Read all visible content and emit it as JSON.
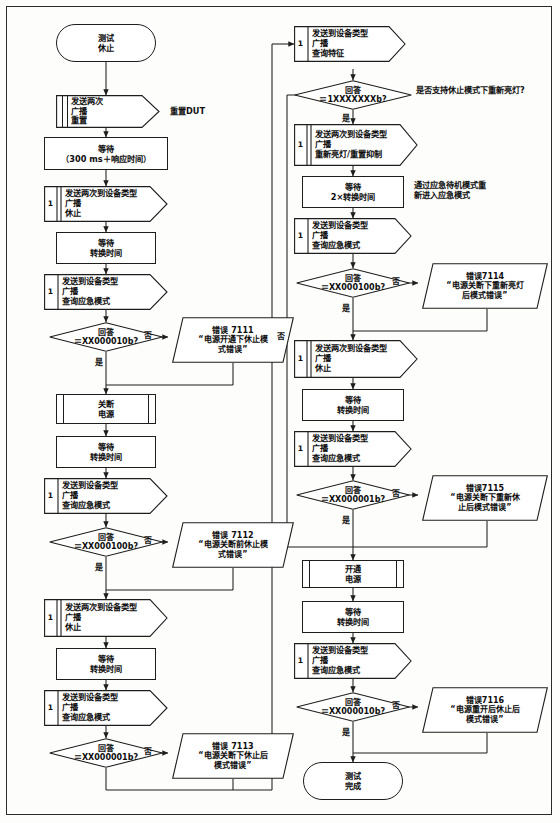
{
  "diagram": {
    "type": "flowchart",
    "labels": {
      "yes": "是",
      "no": "否"
    },
    "annotations": [
      {
        "id": "anno-reset-dut",
        "text": "重置DUT",
        "lines": [
          "重置DUT"
        ]
      },
      {
        "id": "anno-support-question",
        "text": "是否支持休止模式下重新亮灯?",
        "lines": [
          "是否支持休止模式下重新亮灯?"
        ]
      },
      {
        "id": "anno-reenter-emergency",
        "text": "通过应急待机模式重新进入应急模式",
        "lines": [
          "通过应急待机模式重",
          "新进入应急模式"
        ]
      }
    ],
    "left_column": [
      {
        "id": "start",
        "shape": "terminator",
        "lines": [
          "测试",
          "休止"
        ]
      },
      {
        "id": "send-reset",
        "shape": "send",
        "index": "",
        "lines": [
          "发送两次",
          "广播",
          "重置"
        ]
      },
      {
        "id": "wait-300ms",
        "shape": "process",
        "lines": [
          "等待",
          "（300 ms＋响应时间）"
        ]
      },
      {
        "id": "send-rest-1",
        "shape": "send",
        "index": "1",
        "double": true,
        "lines": [
          "发送两次到设备类型",
          "广播",
          "休止"
        ]
      },
      {
        "id": "wait-switch-1",
        "shape": "process",
        "lines": [
          "等待",
          "转换时间"
        ]
      },
      {
        "id": "query-mode-1",
        "shape": "send",
        "index": "1",
        "lines": [
          "发送到设备类型",
          "广播",
          "查询应急模式"
        ]
      },
      {
        "id": "dec-7111",
        "shape": "decision",
        "lines": [
          "回答",
          "＝XX000010b?"
        ]
      },
      {
        "id": "err-7111",
        "shape": "error",
        "lines": [
          "错误  7111",
          "“电源开通下休止模",
          "式错误”"
        ]
      },
      {
        "id": "power-off",
        "shape": "predefined",
        "lines": [
          "关断",
          "电源"
        ]
      },
      {
        "id": "wait-switch-2",
        "shape": "process",
        "lines": [
          "等待",
          "转换时间"
        ]
      },
      {
        "id": "query-mode-2",
        "shape": "send",
        "index": "1",
        "lines": [
          "发送到设备类型",
          "广播",
          "查询应急模式"
        ]
      },
      {
        "id": "dec-7112",
        "shape": "decision",
        "lines": [
          "回答",
          "＝XX000100b?"
        ]
      },
      {
        "id": "err-7112",
        "shape": "error",
        "lines": [
          "错误  7112",
          "“电源关断前休止模",
          "式错误”"
        ]
      },
      {
        "id": "send-rest-2",
        "shape": "send",
        "index": "1",
        "double": true,
        "lines": [
          "发送两次到设备类型",
          "广播",
          "休止"
        ]
      },
      {
        "id": "wait-switch-3",
        "shape": "process",
        "lines": [
          "等待",
          "转换时间"
        ]
      },
      {
        "id": "query-mode-3",
        "shape": "send",
        "index": "1",
        "lines": [
          "发送到设备类型",
          "广播",
          "查询应急模式"
        ]
      },
      {
        "id": "dec-7113",
        "shape": "decision",
        "lines": [
          "回答",
          "＝XX000001b?"
        ]
      },
      {
        "id": "err-7113",
        "shape": "error",
        "lines": [
          "错误  7113",
          "“电源关断下休止后",
          "模式错误”"
        ]
      }
    ],
    "right_column": [
      {
        "id": "query-feature",
        "shape": "send",
        "index": "1",
        "lines": [
          "发送到设备类型",
          "广播",
          "查询特征"
        ]
      },
      {
        "id": "dec-support",
        "shape": "decision",
        "lines": [
          "回答",
          "＝1XXXXXXXb?"
        ]
      },
      {
        "id": "send-relight",
        "shape": "send",
        "index": "1",
        "double": true,
        "lines": [
          "发送两次到设备类型",
          "广播",
          "重新亮灯/重置抑制"
        ]
      },
      {
        "id": "wait-2x",
        "shape": "process",
        "lines": [
          "等待",
          "2×转换时间"
        ]
      },
      {
        "id": "query-mode-4",
        "shape": "send",
        "index": "1",
        "lines": [
          "发送到设备类型",
          "广播",
          "查询应急模式"
        ]
      },
      {
        "id": "dec-7114",
        "shape": "decision",
        "lines": [
          "回答",
          "＝XX000100b?"
        ]
      },
      {
        "id": "err-7114",
        "shape": "error",
        "lines": [
          "错误7114",
          "“电源关断下重新亮灯",
          "后模式错误”"
        ]
      },
      {
        "id": "send-rest-3",
        "shape": "send",
        "index": "1",
        "double": true,
        "lines": [
          "发送两次到设备类型",
          "广播",
          "休止"
        ]
      },
      {
        "id": "wait-switch-4",
        "shape": "process",
        "lines": [
          "等待",
          "转换时间"
        ]
      },
      {
        "id": "query-mode-5",
        "shape": "send",
        "index": "1",
        "lines": [
          "发送到设备类型",
          "广播",
          "查询应急模式"
        ]
      },
      {
        "id": "dec-7115",
        "shape": "decision",
        "lines": [
          "回答",
          "＝XX000001b?"
        ]
      },
      {
        "id": "err-7115",
        "shape": "error",
        "lines": [
          "错误7115",
          "“电源关断下重新休",
          "止后模式错误”"
        ]
      },
      {
        "id": "power-on",
        "shape": "predefined",
        "lines": [
          "开通",
          "电源"
        ]
      },
      {
        "id": "wait-switch-5",
        "shape": "process",
        "lines": [
          "等待",
          "转换时间"
        ]
      },
      {
        "id": "query-mode-6",
        "shape": "send",
        "index": "1",
        "lines": [
          "发送到设备类型",
          "广播",
          "查询应急模式"
        ]
      },
      {
        "id": "dec-7116",
        "shape": "decision",
        "lines": [
          "回答",
          "＝XX000010b?"
        ]
      },
      {
        "id": "err-7116",
        "shape": "error",
        "lines": [
          "错误7116",
          "“电源重开后休止后",
          "模式错误”"
        ]
      },
      {
        "id": "end",
        "shape": "terminator",
        "lines": [
          "测试",
          "完成"
        ]
      }
    ],
    "edge_labels": [
      {
        "id": "lbl-yes-7111",
        "text": "是"
      },
      {
        "id": "lbl-no-7111",
        "text": "否"
      },
      {
        "id": "lbl-yes-7112",
        "text": "是"
      },
      {
        "id": "lbl-no-7112",
        "text": "否"
      },
      {
        "id": "lbl-yes-7113",
        "text": "是"
      },
      {
        "id": "lbl-no-7113",
        "text": "否"
      },
      {
        "id": "lbl-yes-support",
        "text": "是"
      },
      {
        "id": "lbl-no-support",
        "text": "否"
      },
      {
        "id": "lbl-yes-7114",
        "text": "是"
      },
      {
        "id": "lbl-no-7114",
        "text": "否"
      },
      {
        "id": "lbl-yes-7115",
        "text": "是"
      },
      {
        "id": "lbl-no-7115",
        "text": "否"
      },
      {
        "id": "lbl-yes-7116",
        "text": "是"
      },
      {
        "id": "lbl-no-7116",
        "text": "否"
      }
    ],
    "colors": {
      "stroke": "#1d1d1d",
      "text": "#0d0d0d",
      "background": "#fdfdfb"
    }
  }
}
